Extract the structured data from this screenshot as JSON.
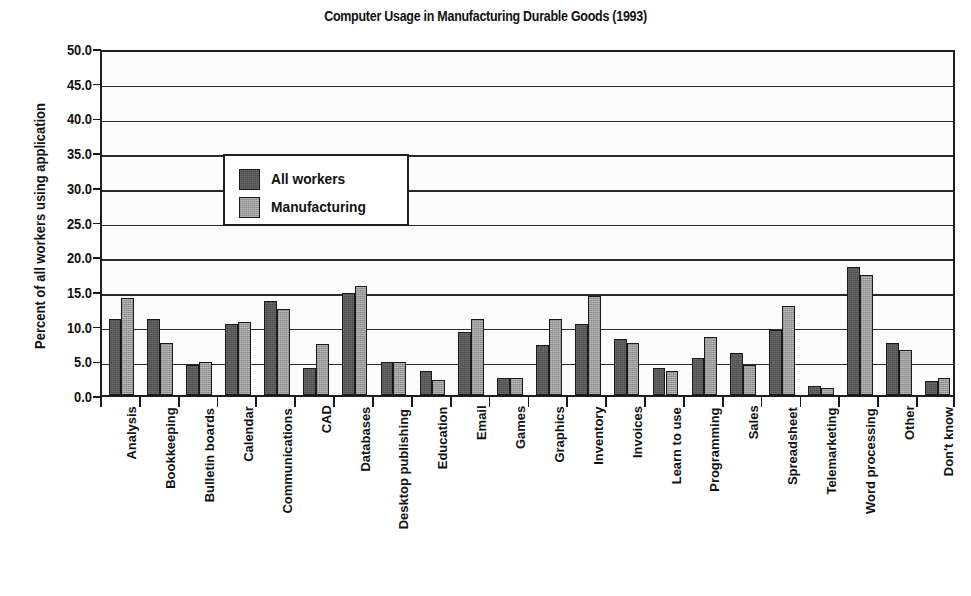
{
  "chart_data": {
    "type": "bar",
    "title": "Computer Usage in Manufacturing Durable Goods (1993)",
    "xlabel": "",
    "ylabel": "Percent of all workers using application",
    "ylim": [
      0,
      50
    ],
    "ytick_step": 5,
    "ytick_labels": [
      "50.0",
      "45.0",
      "40.0",
      "35.0",
      "30.0",
      "25.0",
      "20.0",
      "15.0",
      "10.0",
      "5.0",
      "0.0"
    ],
    "grid": true,
    "legend_position": "upper-left-inside",
    "categories": [
      "Analysis",
      "Bookkeeping",
      "Bulletin boards",
      "Calendar",
      "Communications",
      "CAD",
      "Databases",
      "Desktop publishing",
      "Education",
      "Email",
      "Games",
      "Graphics",
      "Inventory",
      "Invoices",
      "Learn to use",
      "Programming",
      "Sales",
      "Spreadsheet",
      "Telemarketing",
      "Word processing",
      "Other",
      "Don't know"
    ],
    "series": [
      {
        "name": "All workers",
        "color": "#4d4d4d",
        "values": [
          11.0,
          11.0,
          4.3,
          10.2,
          13.5,
          3.9,
          14.7,
          4.8,
          3.5,
          9.1,
          2.5,
          7.2,
          10.3,
          8.0,
          3.9,
          5.3,
          6.0,
          9.4,
          1.3,
          18.5,
          7.5,
          2.0
        ]
      },
      {
        "name": "Manufacturing",
        "color": "#9b9b9b",
        "values": [
          14.0,
          7.5,
          4.8,
          10.5,
          12.4,
          7.4,
          15.7,
          4.8,
          2.1,
          10.9,
          2.5,
          11.0,
          14.3,
          7.5,
          3.4,
          8.3,
          4.3,
          12.8,
          1.0,
          17.3,
          6.5,
          2.4
        ]
      }
    ]
  },
  "legend": {
    "items": [
      {
        "label": "All workers"
      },
      {
        "label": "Manufacturing"
      }
    ]
  }
}
